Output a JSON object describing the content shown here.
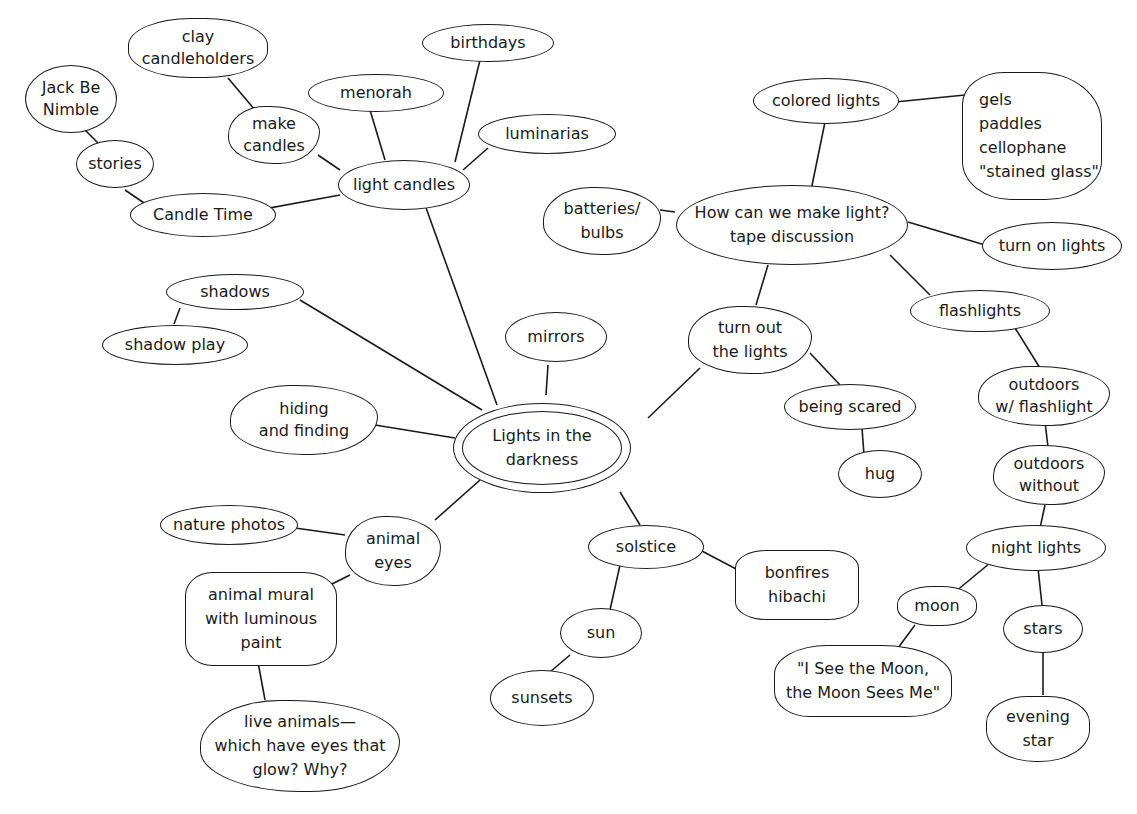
{
  "center": "Lights in the\ndarkness",
  "nodes": {
    "light_candles": "light candles",
    "menorah": "menorah",
    "birthdays": "birthdays",
    "luminarias": "luminarias",
    "make_candles": "make\ncandles",
    "clay_candleholders": "clay\ncandleholders",
    "candle_time": "Candle Time",
    "stories": "stories",
    "jack_be_nimble": "Jack Be\nNimble",
    "shadows": "shadows",
    "shadow_play": "shadow play",
    "hiding_finding": "hiding\nand finding",
    "mirrors": "mirrors",
    "animal_eyes": "animal\neyes",
    "nature_photos": "nature photos",
    "animal_mural": "animal mural\nwith luminous\npaint",
    "live_animals": "live animals—\nwhich have eyes that\nglow? Why?",
    "solstice": "solstice",
    "bonfires": "bonfires\nhibachi",
    "sun": "sun",
    "sunsets": "sunsets",
    "turn_out_lights": "turn out\nthe lights",
    "being_scared": "being scared",
    "hug": "hug",
    "how_make_light": "How can we make light?\ntape discussion",
    "batteries": "batteries/\nbulbs",
    "colored_lights": "colored lights",
    "gels": "gels\npaddles\ncellophane\n\"stained glass\"",
    "turn_on_lights": "turn on lights",
    "flashlights": "flashlights",
    "outdoors_with": "outdoors\nw/ flashlight",
    "outdoors_without": "outdoors\nwithout",
    "night_lights": "night lights",
    "moon": "moon",
    "see_the_moon": "\"I See the Moon,\nthe Moon Sees Me\"",
    "stars": "stars",
    "evening_star": "evening\nstar"
  },
  "colors": {
    "ink": "#1a1a1a",
    "background": "#ffffff"
  }
}
